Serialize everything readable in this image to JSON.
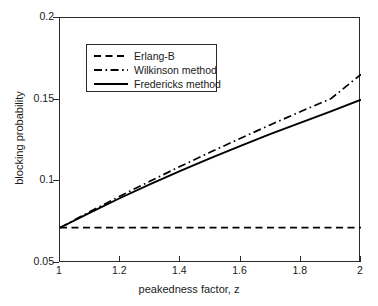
{
  "chart_data": {
    "type": "line",
    "title": "",
    "xlabel": "peakedness factor, z",
    "ylabel": "blocking probability",
    "xlim": [
      1,
      2
    ],
    "ylim": [
      0.05,
      0.2
    ],
    "xticks": [
      "1",
      "1.2",
      "1.4",
      "1.6",
      "1.8",
      "2"
    ],
    "xtick_values": [
      1,
      1.2,
      1.4,
      1.6,
      1.8,
      2
    ],
    "yticks": [
      "0.05",
      "0.1",
      "0.15",
      "0.2"
    ],
    "ytick_values": [
      0.05,
      0.1,
      0.15,
      0.2
    ],
    "grid": false,
    "legend_position": "upper-left-inside",
    "x": [
      1,
      1.1,
      1.2,
      1.3,
      1.4,
      1.5,
      1.6,
      1.7,
      1.8,
      1.9,
      2
    ],
    "series": [
      {
        "name": "Erlang-B",
        "style": "dashed",
        "color": "#000000",
        "values": [
          0.0716,
          0.0716,
          0.0716,
          0.0716,
          0.0716,
          0.0716,
          0.0716,
          0.0716,
          0.0716,
          0.0716,
          0.0716
        ]
      },
      {
        "name": "Wilkinson method",
        "style": "dash-dot",
        "color": "#000000",
        "values": [
          0.0716,
          0.0815,
          0.091,
          0.1002,
          0.1092,
          0.1179,
          0.1264,
          0.1347,
          0.1428,
          0.1506,
          0.1655
        ]
      },
      {
        "name": "Fredericks method",
        "style": "solid",
        "color": "#000000",
        "values": [
          0.0716,
          0.0809,
          0.0898,
          0.0983,
          0.1064,
          0.1142,
          0.1217,
          0.129,
          0.136,
          0.1428,
          0.15
        ]
      }
    ]
  },
  "legend": {
    "items": [
      {
        "label": "Erlang-B",
        "style": "dashed"
      },
      {
        "label": "Wilkinson method",
        "style": "dash-dot"
      },
      {
        "label": "Fredericks method",
        "style": "solid"
      }
    ]
  }
}
